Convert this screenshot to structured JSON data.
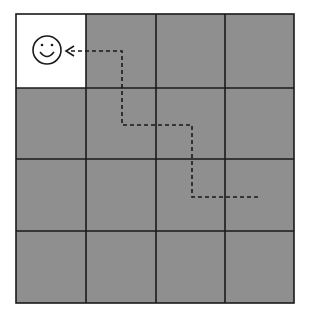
{
  "grid": {
    "rows": 4,
    "cols": 4,
    "cell_fill": "#8f8f8f",
    "highlight_fill": "#ffffff",
    "line_color": "#1a1a1a",
    "highlight_cell": {
      "row": 0,
      "col": 0
    }
  },
  "agent": {
    "icon": "smiley-face-icon",
    "cell": {
      "row": 0,
      "col": 0
    }
  },
  "path": {
    "style": "dashed",
    "points": [
      [
        258,
        197
      ],
      [
        192,
        197
      ],
      [
        192,
        125
      ],
      [
        122,
        125
      ],
      [
        122,
        51
      ],
      [
        66,
        51
      ]
    ],
    "end": "arrow"
  }
}
